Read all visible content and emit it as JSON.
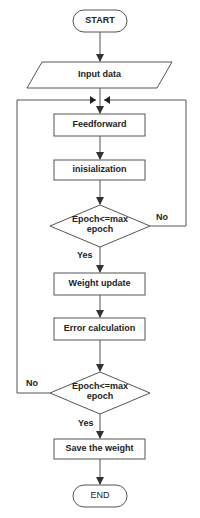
{
  "diagram": {
    "type": "flowchart",
    "colors": {
      "stroke": "#555555",
      "fill": "#ffffff",
      "text": "#222222"
    },
    "nodes": {
      "start": {
        "shape": "terminator",
        "label": "START"
      },
      "input": {
        "shape": "parallelogram",
        "label": "Input data"
      },
      "feedforward": {
        "shape": "process",
        "label": "Feedforward"
      },
      "init": {
        "shape": "process",
        "label": "inisialization"
      },
      "decision1": {
        "shape": "decision",
        "label_line1": "Epoch<=max",
        "label_line2": "epoch"
      },
      "weight_update": {
        "shape": "process",
        "label": "Weight update"
      },
      "error_calc": {
        "shape": "process",
        "label": "Error calculation"
      },
      "decision2": {
        "shape": "decision",
        "label_line1": "Epoch<=max",
        "label_line2": "epoch"
      },
      "save": {
        "shape": "process",
        "label": "Save the weight"
      },
      "end": {
        "shape": "terminator",
        "label": "END"
      }
    },
    "edges": {
      "d1_yes": "Yes",
      "d1_no": "No",
      "d2_yes": "Yes",
      "d2_no": "No"
    }
  }
}
